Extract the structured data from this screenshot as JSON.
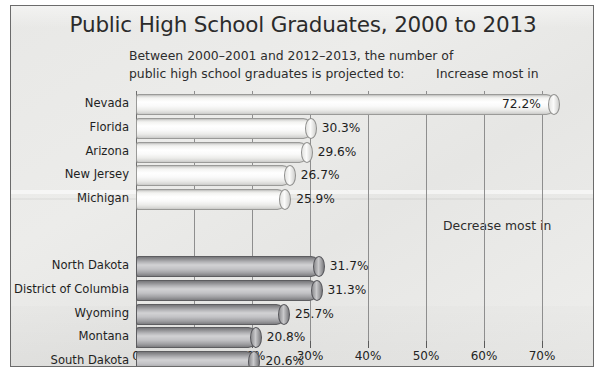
{
  "figure": {
    "title": "Public High School Graduates, 2000 to 2013",
    "subtitle_line_1": "Between 2000–2001 and 2012–2013, the number of",
    "subtitle_line_2": "public high school graduates is projected to:",
    "caption_increase": "Increase most in",
    "caption_decrease": "Decrease most in",
    "frame_color": "#6b6b6b",
    "background_color": "#ececea"
  },
  "chart_data": {
    "type": "bar",
    "orientation": "horizontal",
    "title": "Public High School Graduates, 2000 to 2013",
    "subtitle": "Between 2000–2001 and 2012–2013, the number of public high school graduates is projected to:",
    "xlabel": "",
    "ylabel": "",
    "xlim": [
      0,
      75
    ],
    "xticks": [
      0,
      10,
      20,
      30,
      40,
      50,
      60,
      70
    ],
    "xtick_labels": [
      "0",
      "10%",
      "20%",
      "30%",
      "40%",
      "50%",
      "60%",
      "70%"
    ],
    "grid": true,
    "legend": false,
    "groups": [
      {
        "name": "increase",
        "label": "Increase most in",
        "bar_style": "light-cylinder",
        "bar_color": "#f5f5f3",
        "categories": [
          "Nevada",
          "Florida",
          "Arizona",
          "New Jersey",
          "Michigan"
        ],
        "values": [
          72.2,
          30.3,
          29.6,
          26.7,
          25.9
        ],
        "value_labels": [
          "72.2%",
          "30.3%",
          "29.6%",
          "26.7%",
          "25.9%"
        ]
      },
      {
        "name": "decrease",
        "label": "Decrease most in",
        "bar_style": "dark-cylinder",
        "bar_color": "#9d9da0",
        "categories": [
          "North Dakota",
          "District of Columbia",
          "Wyoming",
          "Montana",
          "South Dakota"
        ],
        "values": [
          31.7,
          31.3,
          25.7,
          20.8,
          20.6
        ],
        "value_labels": [
          "31.7%",
          "31.3%",
          "25.7%",
          "20.8%",
          "20.6%"
        ]
      }
    ]
  }
}
